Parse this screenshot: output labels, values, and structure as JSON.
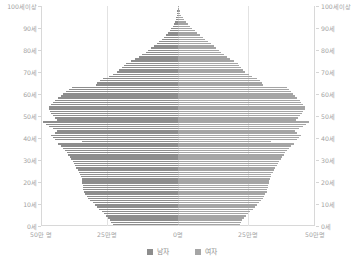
{
  "chart_data": {
    "type": "bar",
    "subtype": "population-pyramid",
    "title": "",
    "xlabel": "",
    "ylabel": "",
    "orientation": "horizontal",
    "grid": true,
    "legend_position": "bottom-center",
    "axis": {
      "y_label_top": "100세이상",
      "y_tick_labels": [
        "100세이상",
        "90세",
        "80세",
        "70세",
        "60세",
        "50세",
        "40세",
        "30세",
        "20세",
        "10세",
        "0세"
      ],
      "y_tick_ages": [
        100,
        90,
        80,
        70,
        60,
        50,
        40,
        30,
        20,
        10,
        0
      ],
      "y_axis_duplicated_right": true,
      "x_tick_labels": [
        "50만 명",
        "25만명",
        "0명",
        "25만명",
        "50만명"
      ],
      "x_tick_values": [
        500000,
        250000,
        0,
        250000,
        500000
      ],
      "xlim": [
        -500000,
        500000
      ],
      "ylim": [
        0,
        100
      ]
    },
    "legend": [
      {
        "name": "남자",
        "color": "#8d8d8d",
        "side": "left"
      },
      {
        "name": "여자",
        "color": "#a5a5a5",
        "side": "right"
      }
    ],
    "series": [
      {
        "name": "남자",
        "side": "left",
        "color": "#8d8d8d",
        "unit": "명",
        "values_by_age": [
          238000,
          243000,
          248000,
          255000,
          262000,
          270000,
          279000,
          288000,
          296000,
          304000,
          312000,
          320000,
          327000,
          333000,
          338000,
          342000,
          345000,
          347000,
          348000,
          349000,
          350000,
          352000,
          355000,
          358000,
          362000,
          366000,
          371000,
          376000,
          381000,
          385000,
          390000,
          395000,
          400000,
          406000,
          412000,
          420000,
          428000,
          438000,
          350000,
          448000,
          455000,
          462000,
          448000,
          440000,
          455000,
          470000,
          482000,
          492000,
          440000,
          448000,
          455000,
          462000,
          468000,
          472000,
          470000,
          462000,
          455000,
          448000,
          438000,
          428000,
          418000,
          408000,
          398000,
          388000,
          300000,
          294000,
          286000,
          272000,
          252000,
          238000,
          224000,
          214000,
          204000,
          196000,
          188000,
          172000,
          156000,
          142000,
          130000,
          118000,
          108000,
          98000,
          88000,
          78000,
          69000,
          60000,
          52000,
          44000,
          37000,
          31000,
          25000,
          20000,
          16000,
          12000,
          9000,
          6500,
          4600,
          3100,
          2000,
          1300,
          800,
          450,
          420
        ]
      },
      {
        "name": "여자",
        "side": "right",
        "color": "#a5a5a5",
        "unit": "명",
        "values_by_age": [
          225000,
          230000,
          235000,
          241000,
          248000,
          256000,
          264000,
          272000,
          280000,
          288000,
          295000,
          302000,
          309000,
          314000,
          319000,
          323000,
          326000,
          328000,
          330000,
          331000,
          333000,
          335000,
          338000,
          341000,
          345000,
          350000,
          355000,
          360000,
          365000,
          370000,
          375000,
          380000,
          386000,
          392000,
          398000,
          406000,
          414000,
          424000,
          340000,
          434000,
          441000,
          448000,
          436000,
          428000,
          442000,
          456000,
          468000,
          478000,
          430000,
          438000,
          446000,
          452000,
          458000,
          462000,
          462000,
          456000,
          450000,
          444000,
          436000,
          428000,
          420000,
          412000,
          404000,
          396000,
          310000,
          306000,
          300000,
          288000,
          270000,
          258000,
          246000,
          238000,
          230000,
          224000,
          218000,
          204000,
          190000,
          178000,
          168000,
          158000,
          150000,
          140000,
          130000,
          120000,
          110000,
          100000,
          90000,
          80000,
          70000,
          61000,
          52000,
          44000,
          36000,
          29000,
          22000,
          17000,
          12500,
          8800,
          6000,
          4000,
          2600,
          1600,
          1900
        ]
      }
    ]
  },
  "colors": {
    "male": "#8d8d8d",
    "female": "#a5a5a5",
    "gridline": "#e2e2e2",
    "axis": "#d8d8d8",
    "tick_text": "#a2a2a2",
    "legend_text": "#8e8e8e",
    "background": "#ffffff"
  }
}
